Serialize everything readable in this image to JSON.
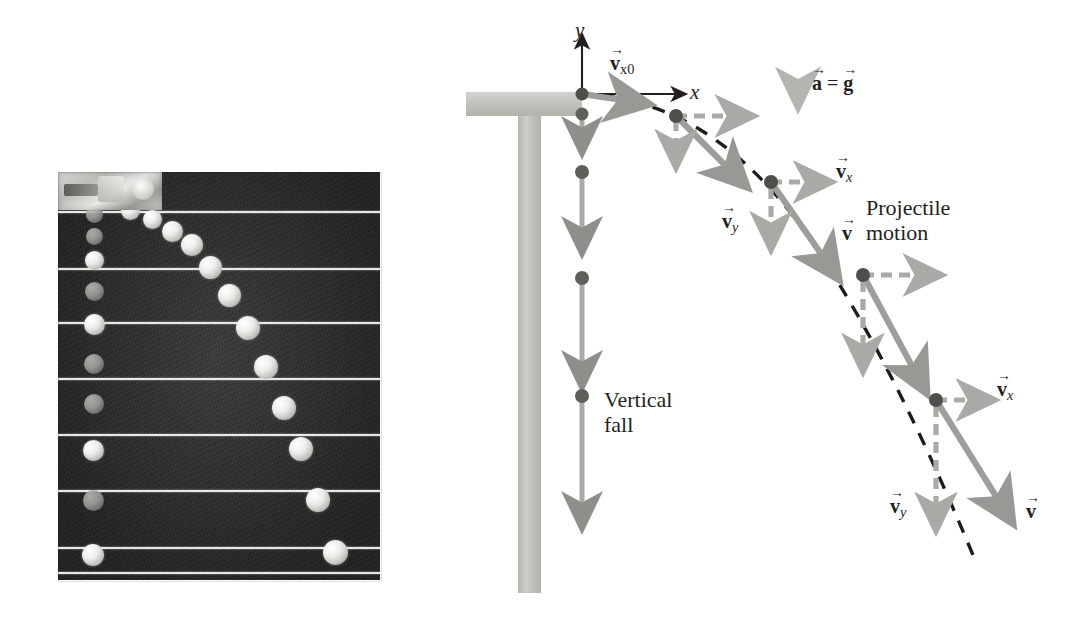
{
  "figure": {
    "background_color": "#ffffff"
  },
  "photo": {
    "name": "strobe-photograph",
    "description": "Multiflash photograph of two balls: one released from rest falling straight down, one launched horizontally",
    "background_color": "#2b2b2b",
    "strobe_line_color": "#e8e8e4",
    "ball_color": "#ffffff",
    "strobe_line_count": 8,
    "dropped_ball_positions": [
      {
        "x": 50,
        "y": 42
      },
      {
        "x": 50,
        "y": 68
      },
      {
        "x": 50,
        "y": 100
      },
      {
        "x": 50,
        "y": 150
      },
      {
        "x": 50,
        "y": 200
      },
      {
        "x": 50,
        "y": 260
      },
      {
        "x": 50,
        "y": 320
      },
      {
        "x": 50,
        "y": 385
      }
    ],
    "projectile_ball_positions": [
      {
        "x": 70,
        "y": 30
      },
      {
        "x": 97,
        "y": 45
      },
      {
        "x": 118,
        "y": 56
      },
      {
        "x": 133,
        "y": 73
      },
      {
        "x": 150,
        "y": 96
      },
      {
        "x": 168,
        "y": 120
      },
      {
        "x": 186,
        "y": 150
      },
      {
        "x": 206,
        "y": 185
      },
      {
        "x": 222,
        "y": 228
      },
      {
        "x": 240,
        "y": 270
      },
      {
        "x": 256,
        "y": 320
      },
      {
        "x": 272,
        "y": 378
      }
    ]
  },
  "diagram": {
    "axes": {
      "origin": {
        "x": 582,
        "y": 94
      },
      "y_label": "y",
      "x_label": "x",
      "axis_color": "#231f20"
    },
    "table": {
      "name": "table-support",
      "color": "#c3c3be",
      "top": {
        "x": 466,
        "y": 92,
        "w": 116,
        "h": 24
      },
      "post": {
        "x": 518,
        "y": 116,
        "w": 23,
        "h": 477
      }
    },
    "labels": {
      "v_x0": {
        "text": "v",
        "sub": "x0",
        "arrow": "→",
        "x": 614,
        "y": 60
      },
      "a_equals_g": {
        "text": "a = g",
        "a": "a",
        "eq": "=",
        "g": "g",
        "x": 812,
        "y": 72
      },
      "vertical_fall": {
        "line1": "Vertical",
        "line2": "fall",
        "x": 608,
        "y": 398
      },
      "projectile_motion": {
        "line1": "Projectile",
        "line2": "motion",
        "x": 872,
        "y": 200
      },
      "v_x_mid": {
        "text": "v",
        "sub": "x",
        "x": 838,
        "y": 170
      },
      "v_y_mid": {
        "text": "v",
        "sub": "y",
        "x": 729,
        "y": 218
      },
      "v_mid": {
        "text": "v",
        "x": 846,
        "y": 228
      },
      "v_x_low": {
        "text": "v",
        "sub": "x",
        "x": 1000,
        "y": 388
      },
      "v_y_low": {
        "text": "v",
        "sub": "y",
        "x": 896,
        "y": 503
      },
      "v_low": {
        "text": "v",
        "x": 1031,
        "y": 508
      }
    },
    "colors": {
      "ball": "#5f5f5c",
      "dashed_trajectory": "#1c1c1c",
      "velocity_arrow_gray": "#a9a9a5",
      "resultant_arrow_gray": "#9d9d99",
      "gravity_arrow": "#b4b4b0",
      "table_gray": "#c3c3be",
      "text": "#231f20"
    },
    "vertical_fall_balls": [
      {
        "x": 582,
        "y": 94,
        "arrow_end": 94
      },
      {
        "x": 582,
        "y": 113,
        "arrow_end": 160
      },
      {
        "x": 582,
        "y": 172,
        "arrow_end": 263
      },
      {
        "x": 582,
        "y": 278,
        "arrow_end": 398
      },
      {
        "x": 582,
        "y": 395,
        "arrow_end": 538
      }
    ],
    "projectile_balls": [
      {
        "x": 582,
        "y": 94,
        "vx_end": 672,
        "vy_end": 94,
        "v_end_x": 672,
        "v_end_y": 101
      },
      {
        "x": 676,
        "y": 116,
        "vx_end": 768,
        "vy_end": 160,
        "v_end_x": 748,
        "v_end_y": 188
      },
      {
        "x": 771,
        "y": 182,
        "vx_end": 862,
        "vy_end": 264,
        "v_end_x": 838,
        "v_end_y": 276
      },
      {
        "x": 863,
        "y": 275,
        "vx_end": 952,
        "vy_end": 390,
        "v_end_x": 930,
        "v_end_y": 392
      },
      {
        "x": 936,
        "y": 400,
        "vx_end": 1026,
        "vy_end": 520,
        "v_end_x": 1022,
        "v_end_y": 520
      }
    ],
    "trajectory_dash": "dashed"
  }
}
